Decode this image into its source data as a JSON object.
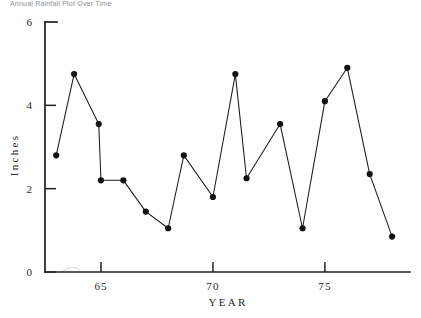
{
  "figure": {
    "partial_caption": "Annual Rainfall Plot Over Time"
  },
  "chart_data": {
    "type": "line",
    "title": "",
    "subtitle": "",
    "xlabel": "YEAR",
    "ylabel": "Inches",
    "xlim": [
      62.5,
      78.8
    ],
    "ylim": [
      0,
      6
    ],
    "grid": false,
    "legend": null,
    "x_tick_labels": [
      "65",
      "70",
      "75"
    ],
    "x_tick_values": [
      65,
      70,
      75
    ],
    "y_tick_labels": [
      "6",
      "4",
      "2",
      "0"
    ],
    "y_tick_values": [
      6,
      4,
      2,
      0
    ],
    "marker": "filled-circle",
    "line_color": "#1a1a1a",
    "marker_color": "#121212",
    "series": [
      {
        "name": "Annual rainfall",
        "x": [
          63.0,
          63.8,
          64.9,
          65.0,
          66.0,
          67.0,
          68.0,
          68.7,
          70.0,
          71.0,
          71.5,
          73.0,
          74.0,
          75.0,
          76.0,
          77.0,
          78.0
        ],
        "values": [
          2.8,
          4.75,
          3.55,
          2.2,
          2.2,
          1.45,
          1.05,
          2.8,
          1.8,
          4.75,
          2.25,
          3.55,
          1.05,
          4.1,
          4.9,
          2.35,
          0.85
        ]
      }
    ]
  }
}
